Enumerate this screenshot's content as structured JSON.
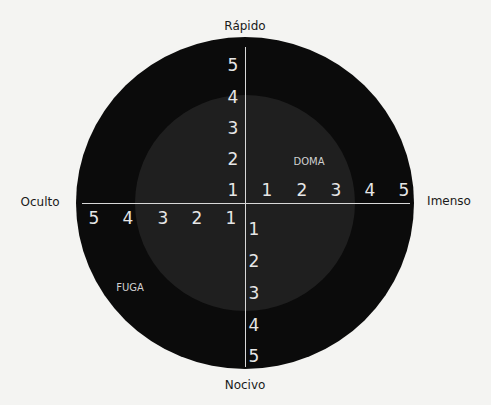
{
  "axes": {
    "top": "Rápido",
    "bottom": "Nocivo",
    "left": "Oculto",
    "right": "Imenso"
  },
  "regions": {
    "upper_right": "DOMA",
    "lower_left": "FUGA"
  },
  "ticks": {
    "up": [
      "5",
      "4",
      "3",
      "2",
      "1"
    ],
    "down": [
      "1",
      "2",
      "3",
      "4",
      "5"
    ],
    "left": [
      "5",
      "4",
      "3",
      "2",
      "1"
    ],
    "right": [
      "1",
      "2",
      "3",
      "4",
      "5"
    ]
  },
  "colors": {
    "outer_circle": "#0b0b0b",
    "inner_circle": "#1f1f1f",
    "axis_lines": "#d8d8d8",
    "tick_text": "#e6e6e6",
    "background": "#f4f4f2"
  }
}
